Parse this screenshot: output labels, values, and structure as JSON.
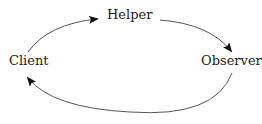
{
  "diagram": {
    "type": "cycle",
    "nodes": [
      {
        "id": "helper",
        "label": "Helper",
        "x": 107,
        "y": 8
      },
      {
        "id": "client",
        "label": "Client",
        "x": 9,
        "y": 54
      },
      {
        "id": "observer",
        "label": "Observer",
        "x": 201,
        "y": 54
      }
    ],
    "edges": [
      {
        "from": "client",
        "to": "helper",
        "path": "M 28 52 Q 48 24 97 19"
      },
      {
        "from": "helper",
        "to": "observer",
        "path": "M 160 20 Q 210 24 231 51"
      },
      {
        "from": "observer",
        "to": "client",
        "path": "M 232 73 Q 215 118 130 112 Q 52 108 28 78"
      }
    ],
    "colors": {
      "line": "#555555",
      "arrowhead": "#111111",
      "text": "#222222",
      "background": "#ffffff"
    }
  }
}
